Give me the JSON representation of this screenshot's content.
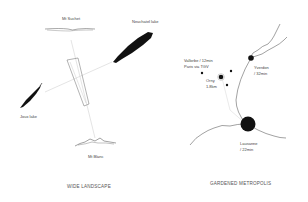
{
  "left_panel": {
    "title": "WIDE LANDSCAPE",
    "labels": {
      "mt_suchet": "Mt Suchet",
      "neuchatel_lake": "Neuchatel lake",
      "joux_lake": "Joux lake",
      "mt_blanc": "Mt Blanc"
    }
  },
  "right_panel": {
    "title": "GARDENED METROPOLIS",
    "labels": {
      "vallorbe_line1": "Vallorbe / 12min",
      "vallorbe_line2": "Paris via TGV",
      "orny_line1": "Orny",
      "orny_line2": "1.8km",
      "yverdon_line1": "Yverdon",
      "yverdon_line2": "/ 32min",
      "lausanne_line1": "Lausanne",
      "lausanne_line2": "/ 22min"
    }
  },
  "colors": {
    "ink": "#111111",
    "line": "#444444",
    "faint_line": "#cfcfcf",
    "background": "#ffffff"
  }
}
